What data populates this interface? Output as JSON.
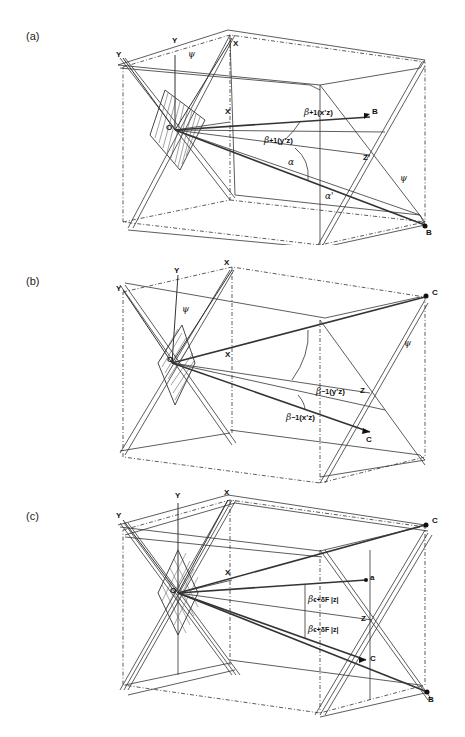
{
  "panels": [
    {
      "id": "a",
      "label": "(a)",
      "labels": {
        "y_axis_left": "Y",
        "y_axis_top": "Y",
        "psi_top": "ψ",
        "x_axis_top": "X",
        "x_axis_mid": "X",
        "origin": "O",
        "beta_xz": "β",
        "beta_xz_sub": "+1",
        "beta_xz_paren": "(x'z)",
        "beta_yz": "β",
        "beta_yz_sub": "+1",
        "beta_yz_paren": "(y'z)",
        "alpha": "α",
        "alpha_prime": "α'",
        "z_point": "Z'",
        "psi_right": "ψ",
        "point_b_upper": "B",
        "point_b_lower": "B"
      }
    },
    {
      "id": "b",
      "label": "(b)",
      "labels": {
        "y_axis_left": "Y",
        "y_axis_top": "Y",
        "psi_top": "ψ",
        "x_axis_top": "X",
        "x_axis_mid": "X",
        "origin": "O",
        "beta_yz": "β",
        "beta_yz_sub": "−1",
        "beta_yz_paren": "(y'z)",
        "beta_xz": "β",
        "beta_xz_sub": "−1",
        "beta_xz_paren": "(x'z)",
        "z_point": "Z",
        "psi_right": "ψ",
        "point_c_upper": "C",
        "point_c_lower": "C"
      }
    },
    {
      "id": "c",
      "label": "(c)",
      "labels": {
        "y_axis_left": "Y",
        "y_axis_top": "Y",
        "x_axis_top": "X",
        "x_axis_mid": "X",
        "origin": "O",
        "beta_upper": "β",
        "beta_upper_sub": "ϵ+δF |z|",
        "beta_lower": "β",
        "beta_lower_sub": "ϵ+δF |z|",
        "z_point": "Z",
        "point_a": "a",
        "point_c_upper": "C",
        "point_c_lower": "C",
        "point_b": "B"
      }
    }
  ]
}
